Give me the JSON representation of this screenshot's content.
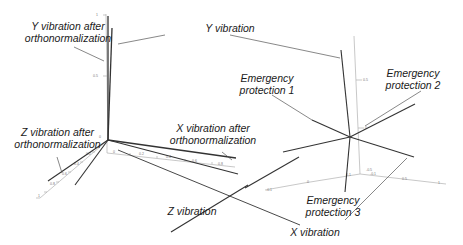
{
  "labels": {
    "y_ortho_l1": "Y vibration after",
    "y_ortho_l2": "orthonormalization",
    "y_vib": "Y vibration",
    "em1_l1": "Emergency",
    "em1_l2": "protection 1",
    "em2_l1": "Emergency",
    "em2_l2": "protection 2",
    "z_ortho_l1": "Z vibration after",
    "z_ortho_l2": "orthonormalization",
    "x_ortho_l1": "X vibration after",
    "x_ortho_l2": "orthonormalization",
    "z_vib": "Z vibration",
    "em3_l1": "Emergency",
    "em3_l2": "protection 3",
    "x_vib": "X vibration"
  },
  "left_plot": {
    "y_axis_ticks": [
      "1",
      "0.5",
      "0"
    ],
    "x_axis_ticks": [
      "0",
      "0.2",
      "0.4",
      "0.6",
      "0.8"
    ],
    "z_axis_ticks": [
      "0.2",
      "0.4",
      "0.6",
      "0.8",
      "1"
    ]
  },
  "right_plot": {
    "y_axis_ticks": [
      "0.5",
      "0"
    ],
    "x_axis_ticks": [
      "-0.1",
      "0",
      "0.1"
    ],
    "z_axis_ticks": [
      "-0.5",
      "-0.1",
      "0.5",
      "1"
    ]
  },
  "colors": {
    "vector": "#333333",
    "leader": "#555555",
    "axis": "#aaaaaa",
    "text": "#1a1a1a"
  }
}
